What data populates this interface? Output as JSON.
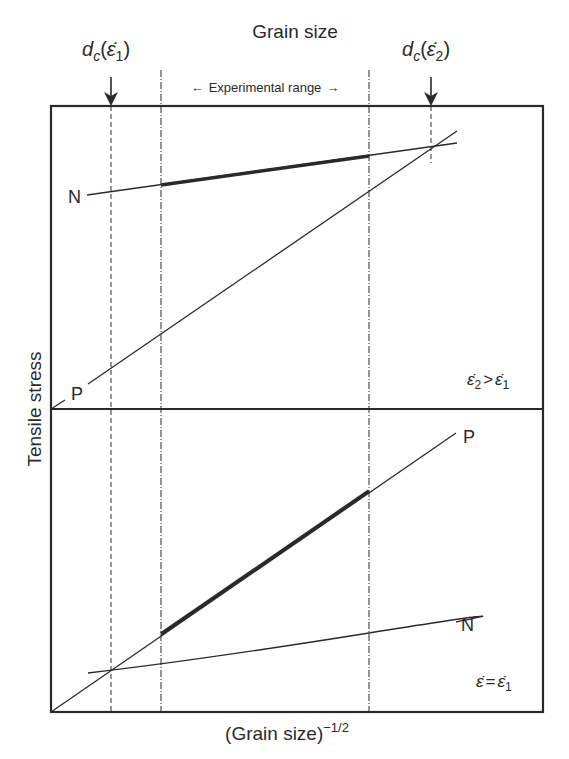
{
  "diagram": {
    "top_title": "Grain size",
    "x_axis_label": "(Grain size)",
    "x_axis_exponent": "−1/2",
    "y_axis_label": "Tensile stress",
    "experimental_range_label": "Experimental range",
    "arrow_left": "←",
    "arrow_right": "→",
    "critical_markers": [
      {
        "d": "d",
        "sub": "c",
        "rate": "ε̇",
        "rate_sub": "1"
      },
      {
        "d": "d",
        "sub": "c",
        "rate": "ε̇",
        "rate_sub": "2"
      }
    ],
    "upper_panel": {
      "condition_lhs": "ε̇",
      "condition_lhs_sub": "2",
      "condition_op": ">",
      "condition_rhs": "ε̇",
      "condition_rhs_sub": "1",
      "lines": [
        {
          "label": "N",
          "description": "Normal Hall-Petch (shallow slope), bold within experimental range"
        },
        {
          "label": "P",
          "description": "Steep line from origin, crosses N at dc(ε̇2)"
        }
      ]
    },
    "lower_panel": {
      "condition_lhs": "ε̇",
      "condition_op": "=",
      "condition_rhs": "ε̇",
      "condition_rhs_sub": "1",
      "lines": [
        {
          "label": "P",
          "description": "Steep line from origin, bold within experimental range"
        },
        {
          "label": "N",
          "description": "Shallow line, crosses P at dc(ε̇1)"
        }
      ]
    },
    "colors": {
      "line": "#2a2a2a",
      "background": "#ffffff"
    }
  }
}
